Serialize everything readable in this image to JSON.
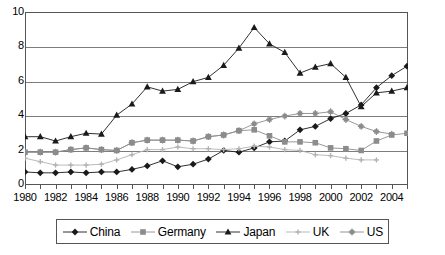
{
  "chart_data": {
    "type": "line",
    "title": "",
    "xlabel": "",
    "ylabel": "",
    "x": [
      1980,
      1981,
      1982,
      1983,
      1984,
      1985,
      1986,
      1987,
      1988,
      1989,
      1990,
      1991,
      1992,
      1993,
      1994,
      1995,
      1996,
      1997,
      1998,
      1999,
      2000,
      2001,
      2002,
      2003,
      2004,
      2005
    ],
    "xlim": [
      1980,
      2005
    ],
    "ylim": [
      0,
      10
    ],
    "yticks": [
      0,
      2,
      4,
      6,
      8,
      10
    ],
    "xticks_labeled": [
      1980,
      1982,
      1984,
      1986,
      1988,
      1990,
      1992,
      1994,
      1996,
      1998,
      2000,
      2002,
      2004
    ],
    "grid": "horizontal",
    "legend_position": "bottom",
    "series": [
      {
        "name": "China",
        "marker": "diamond",
        "color": "#1a1a1a",
        "values": [
          0.7,
          0.65,
          0.65,
          0.7,
          0.65,
          0.7,
          0.7,
          0.85,
          1.05,
          1.35,
          1.0,
          1.15,
          1.45,
          1.95,
          1.85,
          2.1,
          2.45,
          2.5,
          3.15,
          3.35,
          3.8,
          4.1,
          4.6,
          5.6,
          6.3,
          6.85
        ]
      },
      {
        "name": "Germany",
        "marker": "square",
        "color": "#8c8c8c",
        "values": [
          1.85,
          1.85,
          1.85,
          2.0,
          2.1,
          2.0,
          1.95,
          2.4,
          2.55,
          2.55,
          2.55,
          2.5,
          2.75,
          2.85,
          3.1,
          3.15,
          2.8,
          2.45,
          2.45,
          2.4,
          2.1,
          2.05,
          1.95,
          2.5,
          2.85,
          2.95
        ]
      },
      {
        "name": "Japan",
        "marker": "triangle",
        "color": "#1a1a1a",
        "values": [
          2.75,
          2.75,
          2.5,
          2.75,
          2.95,
          2.9,
          4.0,
          4.65,
          5.65,
          5.4,
          5.5,
          5.95,
          6.2,
          6.9,
          7.9,
          9.1,
          8.15,
          7.65,
          6.45,
          6.8,
          7.0,
          6.2,
          4.5,
          5.3,
          5.4,
          5.6
        ]
      },
      {
        "name": "UK",
        "marker": "cross",
        "color": "#b3b3b3",
        "values": [
          1.5,
          1.3,
          1.1,
          1.1,
          1.1,
          1.15,
          1.4,
          1.7,
          2.0,
          2.0,
          2.15,
          2.05,
          2.05,
          2.0,
          2.05,
          2.2,
          2.15,
          2.0,
          1.95,
          1.7,
          1.65,
          1.5,
          1.4,
          1.4,
          null,
          null
        ]
      },
      {
        "name": "US",
        "marker": "asterisk",
        "color": "#8c8c8c",
        "values": [
          1.85,
          1.85,
          1.85,
          2.0,
          2.1,
          2.0,
          1.95,
          2.4,
          2.55,
          2.55,
          2.55,
          2.5,
          2.75,
          2.85,
          3.1,
          3.5,
          3.75,
          3.95,
          4.1,
          4.1,
          4.2,
          3.75,
          3.35,
          3.05,
          2.9,
          null
        ]
      }
    ]
  },
  "legend": {
    "items": [
      {
        "label": "China",
        "marker": "diamond",
        "color": "#1a1a1a"
      },
      {
        "label": "Germany",
        "marker": "square",
        "color": "#8c8c8c"
      },
      {
        "label": "Japan",
        "marker": "triangle",
        "color": "#1a1a1a"
      },
      {
        "label": "UK",
        "marker": "cross",
        "color": "#b3b3b3"
      },
      {
        "label": "US",
        "marker": "asterisk",
        "color": "#8c8c8c"
      }
    ]
  },
  "axes": {
    "y_labels": [
      "10",
      "8",
      "6",
      "4",
      "2",
      "0"
    ],
    "x_labels": [
      "1980",
      "1982",
      "1984",
      "1986",
      "1988",
      "1990",
      "1992",
      "1994",
      "1996",
      "1998",
      "2000",
      "2002",
      "2004"
    ]
  }
}
